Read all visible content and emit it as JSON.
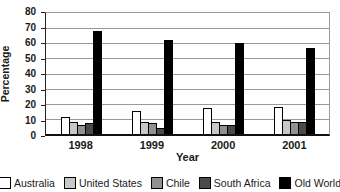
{
  "chart_data": {
    "type": "bar",
    "title": "",
    "xlabel": "Year",
    "ylabel": "Percentage",
    "categories": [
      "1998",
      "1999",
      "2000",
      "2001"
    ],
    "series": [
      {
        "name": "Australia",
        "color": "#ffffff",
        "values": [
          11,
          15,
          17,
          18
        ]
      },
      {
        "name": "United States",
        "color": "#c8c8c8",
        "values": [
          8,
          8,
          8,
          9
        ]
      },
      {
        "name": "Chile",
        "color": "#919191",
        "values": [
          6,
          7,
          6,
          8
        ]
      },
      {
        "name": "South Africa",
        "color": "#4a4a4a",
        "values": [
          7,
          4,
          6,
          8
        ]
      },
      {
        "name": "Old World",
        "color": "#000000",
        "values": [
          68,
          62,
          60,
          57
        ]
      }
    ],
    "ylim": [
      0,
      80
    ],
    "y_ticks": [
      0,
      10,
      20,
      30,
      40,
      50,
      60,
      70,
      80
    ],
    "grid": true,
    "legend_position": "bottom",
    "colors": {
      "bar_outline": "#000000",
      "gridline": "#9a9a9a",
      "axis": "#111111",
      "text": "#1a1a1a",
      "background": "#ffffff"
    }
  }
}
